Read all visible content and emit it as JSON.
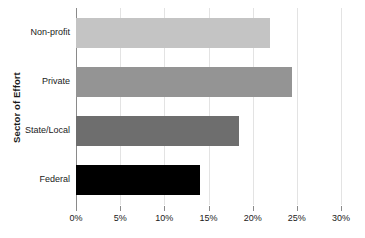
{
  "chart_data": {
    "type": "bar",
    "orientation": "horizontal",
    "title": "",
    "xlabel": "",
    "ylabel": "Sector of Effort",
    "categories": [
      "Non-profit",
      "Private",
      "State/Local",
      "Federal"
    ],
    "values": [
      22,
      24.5,
      18.5,
      14
    ],
    "value_labels": [
      "22%",
      "24.5%",
      "18.5%",
      "14%"
    ],
    "bar_colors": [
      "#c4c4c4",
      "#949494",
      "#6e6e6e",
      "#000000"
    ],
    "xlim": [
      0,
      30
    ],
    "xticks": [
      0,
      5,
      10,
      15,
      20,
      25,
      30
    ],
    "xtick_labels": [
      "0%",
      "5%",
      "10%",
      "15%",
      "20%",
      "25%",
      "30%"
    ],
    "grid": true,
    "grid_axis": "x",
    "grid_color": "#e3e3e3",
    "legend": false,
    "legend_position": "none",
    "axis_color": "#8a8a8a",
    "background_color": "#ffffff",
    "text_color": "#1a1a1a"
  }
}
